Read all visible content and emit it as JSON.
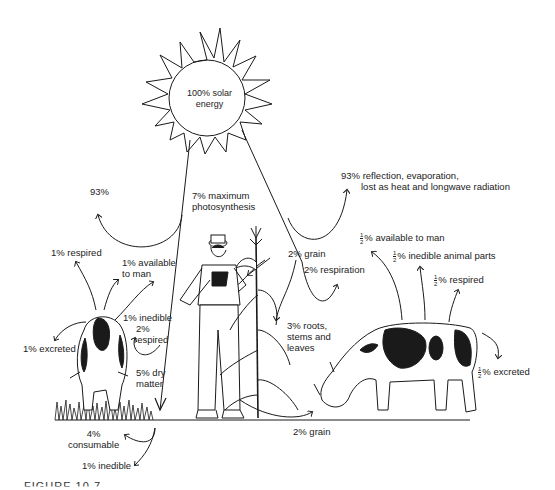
{
  "diagram": {
    "type": "energy-flow",
    "caption": "FIGURE 10.7",
    "sun": {
      "label_line1": "100% solar",
      "label_line2": "energy"
    },
    "labels": {
      "loss_left": "93%",
      "photosynthesis_line1": "7% maximum",
      "photosynthesis_line2": "photosynthesis",
      "loss_right_line1": "93% reflection, evaporation,",
      "loss_right_line2": "lost as heat and longwave radiation",
      "cow1_respired": "1% respired",
      "cow1_available_line1": "1% available",
      "cow1_available_line2": "to man",
      "cow1_excreted": "1% excreted",
      "cow1_inedible": "1% inedible",
      "grass_respired_line1": "2%",
      "grass_respired_line2": "respired",
      "dry_matter_line1": "5% dry",
      "dry_matter_line2": "matter",
      "consumable_line1": "4%",
      "consumable_line2": "consumable",
      "grass_inedible": "1% inedible",
      "corn_grain": "2% grain",
      "corn_respiration": "2% respiration",
      "corn_roots_line1": "3% roots,",
      "corn_roots_line2": "stems and",
      "corn_roots_line3": "leaves",
      "grain_to_cow2": "2% grain",
      "cow2_available": "% available to man",
      "cow2_inedible": "% inedible animal parts",
      "cow2_respired": "% respired",
      "cow2_excreted": "% excreted",
      "half_num": "1",
      "half_den": "2"
    },
    "colors": {
      "ink": "#1a1a1a",
      "background": "#ffffff"
    }
  }
}
